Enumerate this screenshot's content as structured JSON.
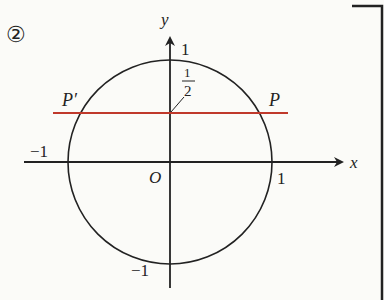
{
  "diagram": {
    "problem_number": "②",
    "axes": {
      "x_label": "x",
      "y_label": "y",
      "origin_label": "O"
    },
    "ticks": {
      "x_pos": "1",
      "x_neg": "−1",
      "y_pos": "1",
      "y_neg": "−1"
    },
    "circle": {
      "type": "unit circle",
      "center": [
        0,
        0
      ],
      "radius": 1
    },
    "line": {
      "equation": "y = 1/2",
      "color": "#c0392b"
    },
    "points": [
      {
        "label": "P",
        "coords": "(√3/2, 1/2)"
      },
      {
        "label": "P′",
        "coords": "(−√3/2, 1/2)"
      }
    ],
    "annotation": {
      "numerator": "1",
      "denominator": "2"
    },
    "colors": {
      "ink": "#222222",
      "line": "#c0392b",
      "background": "#fbfbf8"
    }
  }
}
